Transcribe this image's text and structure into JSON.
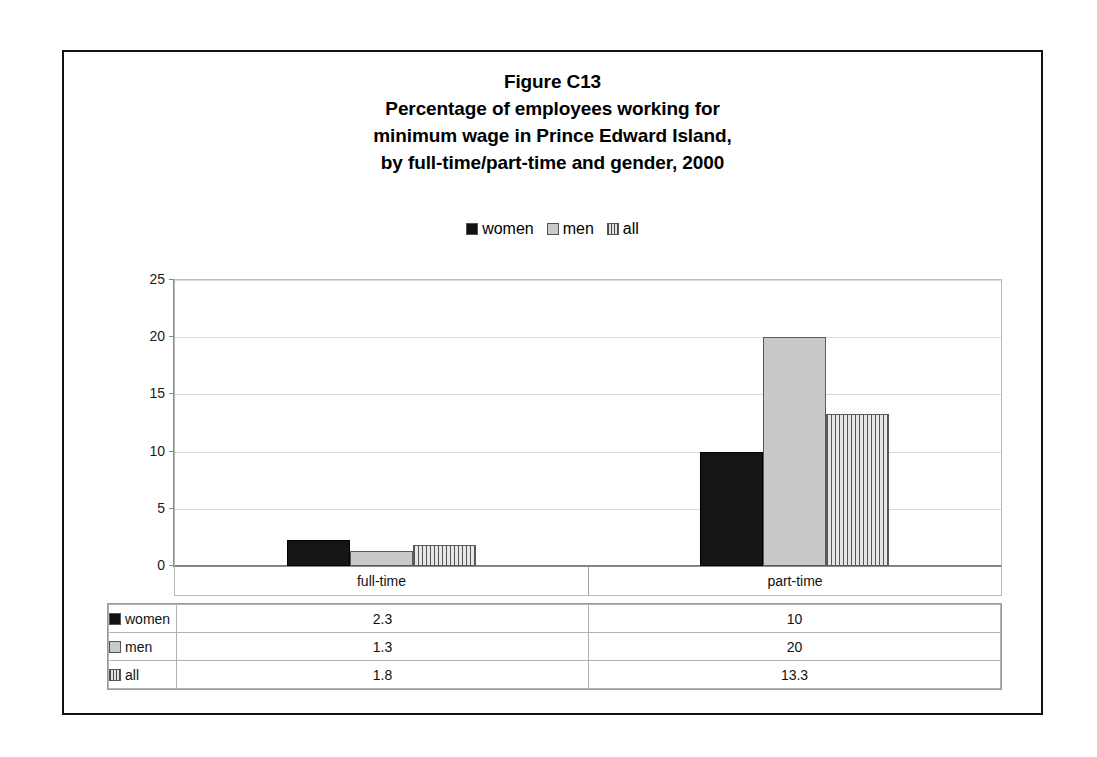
{
  "figure": {
    "title_lines": [
      "Figure C13",
      "Percentage of employees working for",
      "minimum wage in Prince Edward Island,",
      "by full-time/part-time and gender, 2000"
    ]
  },
  "legend": {
    "items": [
      {
        "label": "women",
        "swatch": "solid-black-swatch-icon",
        "color": "#151515"
      },
      {
        "label": "men",
        "swatch": "solid-gray-swatch-icon",
        "color": "#c9c9c9"
      },
      {
        "label": "all",
        "swatch": "vertical-stripe-swatch-icon",
        "color": "#d8d8d8"
      }
    ]
  },
  "axis": {
    "y_ticks": [
      "0",
      "5",
      "10",
      "15",
      "20",
      "25"
    ],
    "y_min": 0,
    "y_max": 25
  },
  "table": {
    "row_keys": [
      "women",
      "men",
      "all"
    ],
    "columns": [
      "full-time",
      "part-time"
    ],
    "cells": [
      [
        "2.3",
        "10"
      ],
      [
        "1.3",
        "20"
      ],
      [
        "1.8",
        "13.3"
      ]
    ]
  },
  "chart_data": {
    "type": "bar",
    "xlabel": "",
    "ylabel": "",
    "categories": [
      "full-time",
      "part-time"
    ],
    "series": [
      {
        "name": "women",
        "values": [
          2.3,
          10
        ]
      },
      {
        "name": "men",
        "values": [
          1.3,
          20
        ]
      },
      {
        "name": "all",
        "values": [
          1.8,
          13.3
        ]
      }
    ],
    "ylim": [
      0,
      25
    ],
    "yticks": [
      0,
      5,
      10,
      15,
      20,
      25
    ],
    "grid": true,
    "legend_position": "top-center"
  }
}
